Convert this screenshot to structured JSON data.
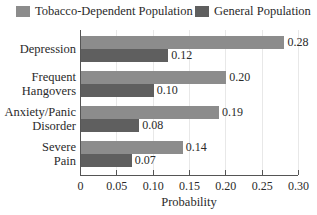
{
  "chart_data": {
    "type": "bar",
    "orientation": "horizontal",
    "title": "",
    "xlabel": "Probability",
    "ylabel": "",
    "xlim": [
      0,
      0.3
    ],
    "xticks": [
      "0",
      "0.05",
      "0.10",
      "0.15",
      "0.20",
      "0.25",
      "0.30"
    ],
    "grid": true,
    "legend_position": "top",
    "categories": [
      "Depression",
      "Frequent Hangovers",
      "Anxiety/Panic Disorder",
      "Severe Pain"
    ],
    "category_lines": [
      [
        "Depression"
      ],
      [
        "Frequent",
        "Hangovers"
      ],
      [
        "Anxiety/Panic",
        "Disorder"
      ],
      [
        "Severe",
        "Pain"
      ]
    ],
    "series": [
      {
        "name": "Tobacco-Dependent Population",
        "color": "#8c8c8c",
        "values": [
          0.28,
          0.2,
          0.19,
          0.14
        ],
        "labels": [
          "0.28",
          "0.20",
          "0.19",
          "0.14"
        ]
      },
      {
        "name": "General Population",
        "color": "#5f5f5f",
        "values": [
          0.12,
          0.1,
          0.08,
          0.07
        ],
        "labels": [
          "0.12",
          "0.10",
          "0.08",
          "0.07"
        ]
      }
    ]
  },
  "legend": [
    {
      "label": "Tobacco-Dependent Population",
      "color": "#8c8c8c"
    },
    {
      "label": "General Population",
      "color": "#5f5f5f"
    }
  ]
}
